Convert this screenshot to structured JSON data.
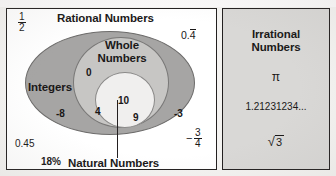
{
  "figure": {
    "top_caption": "",
    "background_color": "#f4f3f1"
  },
  "panels": {
    "rational": {
      "heading": "Rational Numbers",
      "border_color": "#221f1f",
      "background_color": "#ffffff"
    },
    "irrational": {
      "heading_line1": "Irrational",
      "heading_line2": "Numbers",
      "border_color": "#221f1f",
      "background_color": "#d9d8d6",
      "members": {
        "pi": "π",
        "decimal": "1.21231234...",
        "sqrt_sign": "√",
        "sqrt_radicand": "3"
      }
    }
  },
  "sets": {
    "integers": {
      "label": "Integers",
      "fill_color": "#a6a5a4",
      "members": [
        "-8",
        "-3"
      ]
    },
    "whole": {
      "label_line1": "Whole",
      "label_line2": "Numbers",
      "fill_color": "#c7c6c4",
      "members": [
        "0"
      ]
    },
    "natural": {
      "label": "Natural Numbers",
      "fill_color": "#f0efee",
      "members": [
        "4",
        "10",
        "9"
      ]
    }
  },
  "rational_members": {
    "one_half_numerator": "1",
    "one_half_denominator": "2",
    "zero_point_four_repeating_lead": "0.",
    "zero_point_four_repeating_digit": "4",
    "zero_point_four_five": "0.45",
    "eighteen_percent": "18%",
    "neg_three_quarters_sign": "−",
    "neg_three_quarters_numerator": "3",
    "neg_three_quarters_denominator": "4"
  },
  "chart_data": {
    "type": "diagram",
    "subtype": "nested-venn",
    "groups": [
      {
        "name": "Rational Numbers",
        "fill": "#ffffff",
        "level": 0,
        "example_values": [
          "1/2",
          "0.4̅",
          "0.45",
          "18%",
          "-3/4"
        ]
      },
      {
        "name": "Integers",
        "fill": "#a6a5a4",
        "level": 1,
        "example_values": [
          "-8",
          "-3"
        ]
      },
      {
        "name": "Whole Numbers",
        "fill": "#c7c6c4",
        "level": 2,
        "example_values": [
          "0"
        ]
      },
      {
        "name": "Natural Numbers",
        "fill": "#f0efee",
        "level": 3,
        "example_values": [
          "4",
          "10",
          "9"
        ]
      },
      {
        "name": "Irrational Numbers",
        "fill": "#d9d8d6",
        "level": 0,
        "example_values": [
          "π",
          "1.21231234...",
          "√3"
        ]
      }
    ]
  }
}
